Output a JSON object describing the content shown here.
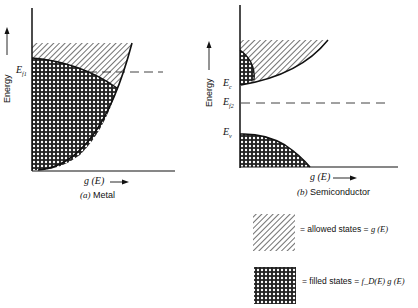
{
  "metal": {
    "y_axis_label": "Energy",
    "fermi_label": "E",
    "fermi_sub": "f1",
    "x_axis_label": "g (E)",
    "caption_letter": "(a)",
    "caption_text": "Metal"
  },
  "semiconductor": {
    "y_axis_label": "Energy",
    "ec_label": "E",
    "ec_sub": "c",
    "fermi_label": "E",
    "fermi_sub": "f2",
    "ev_label": "E",
    "ev_sub": "v",
    "x_axis_label": "g (E)",
    "caption_letter": "(b)",
    "caption_text": "Semiconductor"
  },
  "legend": {
    "allowed_text": "= allowed states =",
    "allowed_formula": "g (E)",
    "filled_text": "= filled states =",
    "filled_formula": "f_D(E) g (E)"
  }
}
